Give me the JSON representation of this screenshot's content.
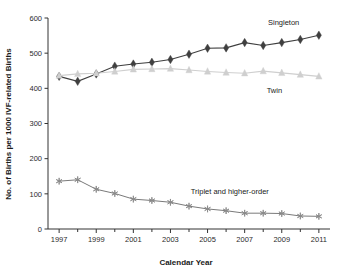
{
  "chart_data": {
    "type": "line",
    "title": "",
    "xlabel": "Calendar Year",
    "ylabel": "No. of Births per 1000 IVF-related Births",
    "x": [
      1997,
      1998,
      1999,
      2000,
      2001,
      2002,
      2003,
      2004,
      2005,
      2006,
      2007,
      2008,
      2009,
      2010,
      2011
    ],
    "xlim": [
      1996.4,
      2011.6
    ],
    "ylim": [
      0,
      600
    ],
    "x_tick_labels": [
      "1997",
      "1999",
      "2001",
      "2003",
      "2005",
      "2007",
      "2009",
      "2011"
    ],
    "x_tick_values": [
      1997,
      1999,
      2001,
      2003,
      2005,
      2007,
      2009,
      2011
    ],
    "x_minor_tick_values": [
      1998,
      2000,
      2002,
      2004,
      2006,
      2008,
      2010
    ],
    "y_tick_labels": [
      "0",
      "100",
      "200",
      "300",
      "400",
      "500",
      "600"
    ],
    "y_tick_values": [
      0,
      100,
      200,
      300,
      400,
      500,
      600
    ],
    "grid": false,
    "legend_position": "inline-annotations",
    "series": [
      {
        "name": "Singleton",
        "marker": "diamond",
        "color": "#3f3f3f",
        "annotation": "Singleton",
        "annotation_x": 2009.1,
        "annotation_y": 580,
        "values": [
          434,
          420,
          441,
          463,
          469,
          474,
          482,
          497,
          514,
          515,
          530,
          522,
          530,
          539,
          551
        ]
      },
      {
        "name": "Twin",
        "marker": "triangle",
        "color": "#cfcfcf",
        "annotation": "Twin",
        "annotation_x": 2008.6,
        "annotation_y": 388,
        "values": [
          436,
          441,
          443,
          448,
          454,
          455,
          456,
          452,
          448,
          445,
          443,
          449,
          444,
          439,
          434
        ]
      },
      {
        "name": "Triplet and higher-order",
        "marker": "asterisk",
        "color": "#8a8a8a",
        "annotation": "Triplet and higher-order",
        "annotation_x": 2006.2,
        "annotation_y": 100,
        "values": [
          136,
          140,
          113,
          101,
          85,
          81,
          76,
          65,
          57,
          52,
          45,
          45,
          44,
          37,
          36
        ]
      }
    ]
  }
}
